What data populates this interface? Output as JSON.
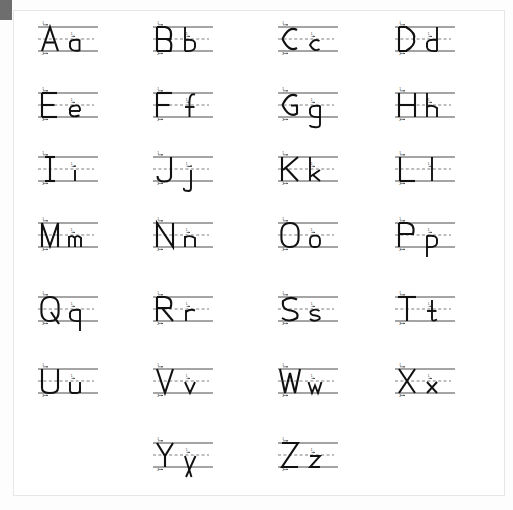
{
  "document": {
    "title": "Alphabet Handwriting Practice Chart",
    "description": "Manuscript letter formation chart showing uppercase and lowercase letters on three-line ruling with numbered stroke-direction arrows.",
    "page_background": "#ffffff",
    "sheet_border_color": "#e6e6e6",
    "corner_tab_color": "#6e6e6e",
    "line_color": "#4a4a4a",
    "dash_line_color": "#7d7d7d",
    "glyph_color": "#111111",
    "arrow_color": "#2a2a2a"
  },
  "layout": {
    "columns": 4,
    "rows": 7,
    "cell_width": 92,
    "cell_height": 46,
    "col_x": [
      35,
      150,
      275,
      392
    ],
    "row_y": [
      18,
      84,
      148,
      214,
      288,
      360,
      434
    ]
  },
  "ruling": {
    "top_label": "top-line",
    "mid_label": "mid-dashed-line",
    "base_label": "base-line",
    "top_y": 8,
    "mid_y": 20,
    "base_y": 32
  },
  "cells": [
    {
      "id": "Aa",
      "upper": "A",
      "lower": "a",
      "row": 0,
      "col": 0,
      "descender": false,
      "ascender": false
    },
    {
      "id": "Bb",
      "upper": "B",
      "lower": "b",
      "row": 0,
      "col": 1,
      "descender": false,
      "ascender": true
    },
    {
      "id": "Cc",
      "upper": "C",
      "lower": "c",
      "row": 0,
      "col": 2,
      "descender": false,
      "ascender": false
    },
    {
      "id": "Dd",
      "upper": "D",
      "lower": "d",
      "row": 0,
      "col": 3,
      "descender": false,
      "ascender": true
    },
    {
      "id": "Ee",
      "upper": "E",
      "lower": "e",
      "row": 1,
      "col": 0,
      "descender": false,
      "ascender": false
    },
    {
      "id": "Ff",
      "upper": "F",
      "lower": "f",
      "row": 1,
      "col": 1,
      "descender": false,
      "ascender": true
    },
    {
      "id": "Gg",
      "upper": "G",
      "lower": "g",
      "row": 1,
      "col": 2,
      "descender": true,
      "ascender": false
    },
    {
      "id": "Hh",
      "upper": "H",
      "lower": "h",
      "row": 1,
      "col": 3,
      "descender": false,
      "ascender": true
    },
    {
      "id": "Ii",
      "upper": "I",
      "lower": "i",
      "row": 2,
      "col": 0,
      "descender": false,
      "ascender": false
    },
    {
      "id": "Jj",
      "upper": "J",
      "lower": "j",
      "row": 2,
      "col": 1,
      "descender": true,
      "ascender": false
    },
    {
      "id": "Kk",
      "upper": "K",
      "lower": "k",
      "row": 2,
      "col": 2,
      "descender": false,
      "ascender": true
    },
    {
      "id": "Ll",
      "upper": "L",
      "lower": "l",
      "row": 2,
      "col": 3,
      "descender": false,
      "ascender": true
    },
    {
      "id": "Mm",
      "upper": "M",
      "lower": "m",
      "row": 3,
      "col": 0,
      "descender": false,
      "ascender": false
    },
    {
      "id": "Nn",
      "upper": "N",
      "lower": "n",
      "row": 3,
      "col": 1,
      "descender": false,
      "ascender": false
    },
    {
      "id": "Oo",
      "upper": "O",
      "lower": "o",
      "row": 3,
      "col": 2,
      "descender": false,
      "ascender": false
    },
    {
      "id": "Pp",
      "upper": "P",
      "lower": "p",
      "row": 3,
      "col": 3,
      "descender": true,
      "ascender": false
    },
    {
      "id": "Qq",
      "upper": "Q",
      "lower": "q",
      "row": 4,
      "col": 0,
      "descender": true,
      "ascender": false
    },
    {
      "id": "Rr",
      "upper": "R",
      "lower": "r",
      "row": 4,
      "col": 1,
      "descender": false,
      "ascender": false
    },
    {
      "id": "Ss",
      "upper": "S",
      "lower": "s",
      "row": 4,
      "col": 2,
      "descender": false,
      "ascender": false
    },
    {
      "id": "Tt",
      "upper": "T",
      "lower": "t",
      "row": 4,
      "col": 3,
      "descender": false,
      "ascender": true
    },
    {
      "id": "Uu",
      "upper": "U",
      "lower": "u",
      "row": 5,
      "col": 0,
      "descender": false,
      "ascender": false
    },
    {
      "id": "Vv",
      "upper": "V",
      "lower": "v",
      "row": 5,
      "col": 1,
      "descender": false,
      "ascender": false
    },
    {
      "id": "Ww",
      "upper": "W",
      "lower": "w",
      "row": 5,
      "col": 2,
      "descender": false,
      "ascender": false
    },
    {
      "id": "Xx",
      "upper": "X",
      "lower": "x",
      "row": 5,
      "col": 3,
      "descender": false,
      "ascender": false
    },
    {
      "id": "Yy",
      "upper": "Y",
      "lower": "y",
      "row": 6,
      "col": 1,
      "descender": true,
      "ascender": false
    },
    {
      "id": "Zz",
      "upper": "Z",
      "lower": "z",
      "row": 6,
      "col": 2,
      "descender": false,
      "ascender": false
    }
  ],
  "stroke_numbers": [
    "1",
    "2",
    "3",
    "4"
  ]
}
